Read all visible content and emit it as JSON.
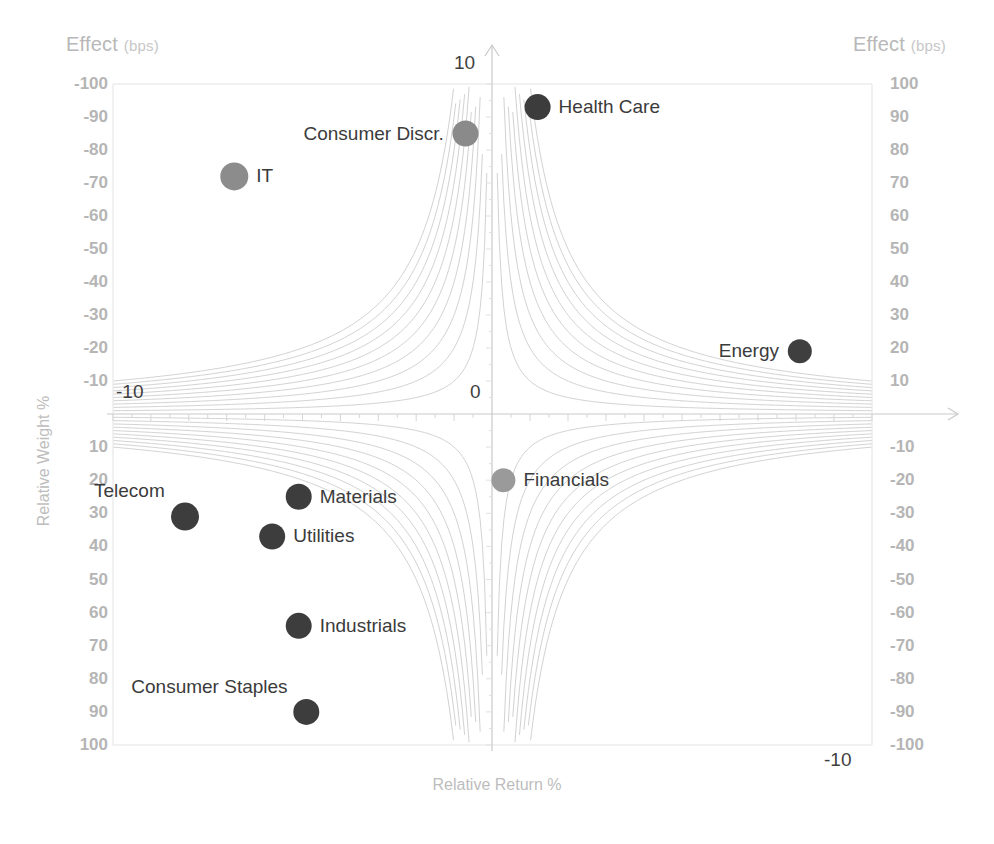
{
  "axes": {
    "effect_label_left": "Effect",
    "effect_label_left_unit": "(bps)",
    "effect_label_right": "Effect",
    "effect_label_right_unit": "(bps)",
    "y_axis_title": "Relative Weight %",
    "x_axis_title": "Relative Return %",
    "x_tick_left": "-10",
    "x_tick_center": "0",
    "x_tick_right": "-10",
    "y_tick_top": "10"
  },
  "left_ticks_upper": [
    "-100",
    "-90",
    "-80",
    "-70",
    "-60",
    "-50",
    "-40",
    "-30",
    "-20",
    "-10"
  ],
  "left_ticks_lower": [
    "10",
    "20",
    "30",
    "40",
    "50",
    "60",
    "70",
    "80",
    "90",
    "100"
  ],
  "right_ticks_upper": [
    "100",
    "90",
    "80",
    "70",
    "60",
    "50",
    "40",
    "30",
    "20",
    "10"
  ],
  "right_ticks_lower": [
    "-10",
    "-20",
    "-30",
    "-40",
    "-50",
    "-60",
    "-70",
    "-80",
    "-90",
    "-100"
  ],
  "chart_data": {
    "type": "scatter",
    "title": "",
    "xlabel": "Relative Return %",
    "ylabel": "Relative Weight %",
    "xlim": [
      -10,
      10
    ],
    "ylim": [
      -10,
      10
    ],
    "grid": false,
    "note": "Four-quadrant attribution bubble chart. Hyperbolic iso-effect contour curves (x*y = constant) fill each quadrant. Left/right secondary axes read Effect in bps, from -100 to 100.",
    "contour_levels_bps": [
      10,
      20,
      30,
      40,
      50,
      60,
      70,
      80,
      90,
      100
    ],
    "series": [
      {
        "name": "Health Care",
        "x": 1.2,
        "y": -9.3,
        "effect_bps": 94,
        "color": "#3c3c3c",
        "radius": 13,
        "label_side": "right"
      },
      {
        "name": "Consumer Discr.",
        "x": -0.7,
        "y": -8.5,
        "effect_bps": 85,
        "color": "#8a8a8a",
        "radius": 13,
        "label_side": "left"
      },
      {
        "name": "IT",
        "x": -6.8,
        "y": -7.2,
        "effect_bps": 72,
        "color": "#8c8c8c",
        "radius": 14,
        "label_side": "right"
      },
      {
        "name": "Energy",
        "x": 8.1,
        "y": -1.9,
        "effect_bps": 18,
        "color": "#3f3f3f",
        "radius": 12,
        "label_side": "left"
      },
      {
        "name": "Financials",
        "x": 0.3,
        "y": 2.0,
        "effect_bps": -20,
        "color": "#9a9a9a",
        "radius": 12,
        "label_side": "right"
      },
      {
        "name": "Materials",
        "x": -5.1,
        "y": 2.5,
        "effect_bps": -25,
        "color": "#3d3d3d",
        "radius": 13,
        "label_side": "right"
      },
      {
        "name": "Telecom",
        "x": -8.1,
        "y": 3.1,
        "effect_bps": -31,
        "color": "#3d3d3d",
        "radius": 14,
        "label_side": "top-left"
      },
      {
        "name": "Utilities",
        "x": -5.8,
        "y": 3.7,
        "effect_bps": -37,
        "color": "#3d3d3d",
        "radius": 13,
        "label_side": "right"
      },
      {
        "name": "Industrials",
        "x": -5.1,
        "y": 6.4,
        "effect_bps": -64,
        "color": "#3d3d3d",
        "radius": 13,
        "label_side": "right"
      },
      {
        "name": "Consumer Staples",
        "x": -4.9,
        "y": 9.0,
        "effect_bps": -90,
        "color": "#3d3d3d",
        "radius": 13,
        "label_side": "top-left"
      }
    ]
  },
  "colors": {
    "tick": "#b5b5b5",
    "axis_title": "#bdbdbd",
    "contour": "#d2d2d2",
    "axis_line": "#c9c9c9",
    "label_text": "#3b3b3b",
    "background": "#ffffff"
  }
}
